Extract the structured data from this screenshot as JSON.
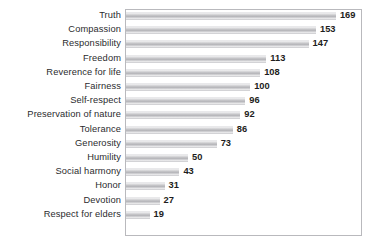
{
  "chart_data": {
    "type": "bar",
    "orientation": "horizontal",
    "title": "",
    "subtitle": "",
    "xlabel": "",
    "ylabel": "",
    "grid": false,
    "legend": false,
    "legend_position": "none",
    "axis_visible": false,
    "tick_labels": [],
    "xlim": [
      0,
      190
    ],
    "value_labels_shown": true,
    "frame_color": "#b9b9bd",
    "bar_color": "#b0b0b4",
    "bar_color_light": "#f2f2f3",
    "label_color": "#2b2b2e",
    "value_color": "#1d1d20",
    "background": "#ffffff",
    "categories": [
      "Truth",
      "Compassion",
      "Responsibility",
      "Freedom",
      "Reverence for life",
      "Fairness",
      "Self-respect",
      "Preservation of nature",
      "Tolerance",
      "Generosity",
      "Humility",
      "Social harmony",
      "Honor",
      "Devotion",
      "Respect for elders"
    ],
    "values": [
      169,
      153,
      147,
      113,
      108,
      100,
      96,
      92,
      86,
      73,
      50,
      43,
      31,
      27,
      19
    ],
    "value_labels": [
      "169",
      "153",
      "147",
      "113",
      "108",
      "100",
      "96",
      "92",
      "86",
      "73",
      "50",
      "43",
      "31",
      "27",
      "19"
    ]
  }
}
